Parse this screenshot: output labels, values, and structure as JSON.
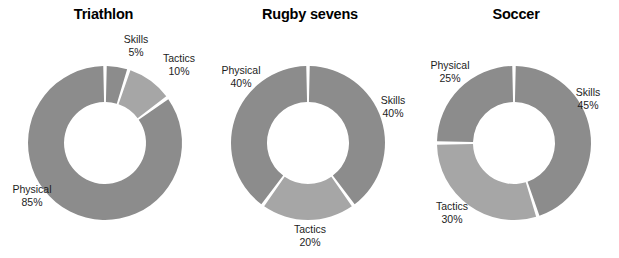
{
  "figure": {
    "width": 619,
    "height": 258,
    "background": "#ffffff"
  },
  "style": {
    "segment_color_dark": "#8c8c8c",
    "segment_color_light": "#a6a6a6",
    "gap_color": "#ffffff",
    "title_color": "#000000",
    "label_color": "#1d1d1d"
  },
  "charts": [
    {
      "title": "Triathlon",
      "center_x": 105,
      "center_y": 143,
      "outer_r": 77,
      "inner_r": 41,
      "labels": {
        "skills": {
          "name": "Skills",
          "pct": "5%",
          "x": 136,
          "y": 33,
          "align": "center"
        },
        "tactics": {
          "name": "Tactics",
          "pct": "10%",
          "x": 179,
          "y": 52,
          "align": "center"
        },
        "physical": {
          "name": "Physical",
          "pct": "85%",
          "x": 32,
          "y": 183,
          "align": "center"
        }
      }
    },
    {
      "title": "Rugby sevens",
      "center_x": 308,
      "center_y": 143,
      "outer_r": 77,
      "inner_r": 41,
      "labels": {
        "skills": {
          "name": "Skills",
          "pct": "40%",
          "x": 398,
          "y": 94,
          "align": "center"
        },
        "tactics": {
          "name": "Tactics",
          "pct": "20%",
          "x": 310,
          "y": 223,
          "align": "center"
        },
        "physical": {
          "name": "Physical",
          "pct": "40%",
          "x": 240,
          "y": 64,
          "align": "center"
        }
      }
    },
    {
      "title": "Soccer",
      "center_x": 514,
      "center_y": 143,
      "outer_r": 77,
      "inner_r": 41,
      "labels": {
        "skills": {
          "name": "Skills",
          "pct": "45%",
          "x": 588,
          "y": 86,
          "align": "center"
        },
        "tactics": {
          "name": "Tactics",
          "pct": "30%",
          "x": 452,
          "y": 200,
          "align": "center"
        },
        "physical": {
          "name": "Physical",
          "pct": "25%",
          "x": 449,
          "y": 59,
          "align": "center"
        }
      }
    }
  ],
  "chart_data": [
    {
      "type": "pie",
      "variant": "donut",
      "title": "Triathlon",
      "categories": [
        "Skills",
        "Tactics",
        "Physical"
      ],
      "values": [
        5,
        10,
        85
      ],
      "value_labels": [
        "5%",
        "10%",
        "85%"
      ],
      "units": "percent",
      "start_angle_deg": 0,
      "direction": "clockwise",
      "inner_radius_ratio": 0.53,
      "colors": [
        "#8c8c8c",
        "#a6a6a6",
        "#8c8c8c"
      ],
      "xlabel": "",
      "ylabel": "",
      "legend": "none",
      "grid": false
    },
    {
      "type": "pie",
      "variant": "donut",
      "title": "Rugby sevens",
      "categories": [
        "Skills",
        "Tactics",
        "Physical"
      ],
      "values": [
        40,
        20,
        40
      ],
      "value_labels": [
        "40%",
        "20%",
        "40%"
      ],
      "units": "percent",
      "start_angle_deg": 0,
      "direction": "clockwise",
      "inner_radius_ratio": 0.53,
      "colors": [
        "#8c8c8c",
        "#a6a6a6",
        "#8c8c8c"
      ],
      "xlabel": "",
      "ylabel": "",
      "legend": "none",
      "grid": false
    },
    {
      "type": "pie",
      "variant": "donut",
      "title": "Soccer",
      "categories": [
        "Skills",
        "Tactics",
        "Physical"
      ],
      "values": [
        45,
        30,
        25
      ],
      "value_labels": [
        "45%",
        "30%",
        "25%"
      ],
      "units": "percent",
      "start_angle_deg": 0,
      "direction": "clockwise",
      "inner_radius_ratio": 0.53,
      "colors": [
        "#8c8c8c",
        "#a6a6a6",
        "#8c8c8c"
      ],
      "xlabel": "",
      "ylabel": "",
      "legend": "none",
      "grid": false
    }
  ]
}
